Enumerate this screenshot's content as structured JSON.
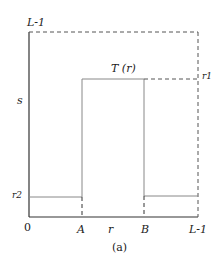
{
  "diagram": {
    "caption": "(a)",
    "function_label": "T (r)",
    "y_axis": {
      "label": "s",
      "top_label": "L-1",
      "r1_label": "r1",
      "r2_label": "r2"
    },
    "x_axis": {
      "label": "r",
      "origin_label": "0",
      "ticks": [
        "A",
        "B",
        "L-1"
      ]
    },
    "colors": {
      "axis": "#333333",
      "line": "#888888",
      "dashed": "#555555",
      "background": "#ffffff"
    }
  }
}
